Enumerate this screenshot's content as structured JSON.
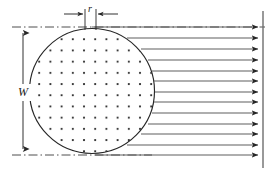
{
  "figure": {
    "type": "engineering-cross-section-flow-diagram",
    "background_color": "#ffffff",
    "line_color": "#262626",
    "dot_color": "#1a1a1a",
    "width": 275,
    "height": 175
  },
  "labels": {
    "width_dimension": "W",
    "radius_dimension": "r"
  },
  "body": {
    "name": "circular-cross-section",
    "center_x": 92,
    "center_y": 91,
    "radius": 63,
    "left_edge": 29,
    "right_edge": 155,
    "top_edge": 28,
    "bottom_edge": 154,
    "fill": "dot-grid",
    "dot_spacing": 11.2,
    "dot_radius": 1.0
  },
  "dimension_lines": {
    "width": {
      "name": "W",
      "x": 23,
      "y_top": 27,
      "y_bottom": 155,
      "arrowheads": "both",
      "label_text": "W",
      "label_x": 23,
      "label_y": 95
    },
    "radius": {
      "name": "r",
      "y": 14,
      "tick_left_x": 85,
      "tick_right_x": 96,
      "tick_y_top": 8,
      "tick_y_bottom": 30,
      "arrow_from_left_x": 64,
      "arrow_from_right_x": 117,
      "label_text": "r",
      "label_x": 90,
      "label_y": 12
    }
  },
  "centerlines": {
    "top": {
      "y": 27,
      "x_start": 12,
      "x_end": 265,
      "style": "dash-dot"
    },
    "bottom": {
      "y": 155,
      "x_start": 12,
      "x_end": 150,
      "style": "dash-dot"
    }
  },
  "flow_field": {
    "name": "horizontal-flow-arrows",
    "count": 13,
    "direction": "right",
    "terminal_line_x": 263,
    "terminal_line_y_top": 12,
    "terminal_line_y_bottom": 168,
    "arrows": [
      {
        "y": 27,
        "x_start": 92
      },
      {
        "y": 38,
        "x_start": 127
      },
      {
        "y": 49,
        "x_start": 141
      },
      {
        "y": 60,
        "x_start": 148
      },
      {
        "y": 71,
        "x_start": 153
      },
      {
        "y": 81,
        "x_start": 155
      },
      {
        "y": 92,
        "x_start": 155
      },
      {
        "y": 102,
        "x_start": 155
      },
      {
        "y": 113,
        "x_start": 153
      },
      {
        "y": 124,
        "x_start": 148
      },
      {
        "y": 134,
        "x_start": 141
      },
      {
        "y": 145,
        "x_start": 127
      },
      {
        "y": 155,
        "x_start": 92
      }
    ]
  }
}
